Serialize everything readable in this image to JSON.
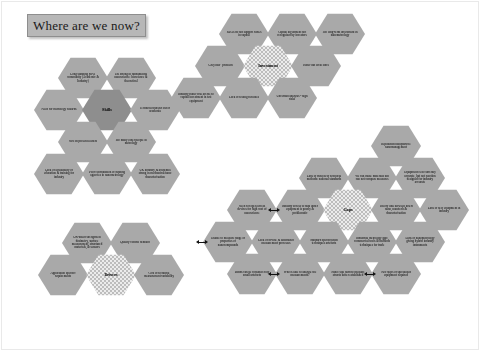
{
  "slide": {
    "title": "Where are we now?",
    "background_color": "#ffffff",
    "hex_fill_color": "#a9a9a9",
    "core_fill_color": "#ececec",
    "title_fill_color": "#b7b7b7"
  },
  "clusters": [
    {
      "id": "skills",
      "core_label": "Skills",
      "cells": [
        {
          "text": "Long standing MNT community (Academic & Industry)"
        },
        {
          "text": "UK strong in fundamental nanoscience: bioscience & theoretical"
        },
        {
          "text": "Need for metrology wizards"
        },
        {
          "text": "Technical transfer out of academia"
        },
        {
          "text": "MN on present leaders"
        },
        {
          "text": "Too many older people in metrology"
        },
        {
          "text": "Lack of availability of education & training for industry"
        },
        {
          "text": "Poor coordination of funding agencies in nanometrology"
        },
        {
          "text": "UK industry & academia strong in mechanical/nano characterisation"
        }
      ]
    },
    {
      "id": "drivers",
      "core_label": "Drivers",
      "cells": [
        {
          "text": "UK-based strengths in dosimetry, surface measurement, structured materials, & sensors"
        },
        {
          "text": "Quality control demand"
        },
        {
          "text": "Application specific requirements"
        },
        {
          "text": "Cost of technical measurement variability"
        }
      ]
    },
    {
      "id": "investment",
      "core_label": "Investment",
      "cells": [
        {
          "text": "RDAs do not support SMEs in capital"
        },
        {
          "text": "Capital investment not recognised by investors"
        },
        {
          "text": "Too long-term investment in nanometrology"
        },
        {
          "text": "\"Grey hair\" problem"
        },
        {
          "text": "Faster but local since"
        },
        {
          "text": "Industry rather risk averse to capital investment in test equipment"
        },
        {
          "text": "Lack of testing facilities"
        },
        {
          "text": "Uncertain analysis - high risks"
        }
      ]
    },
    {
      "id": "gaps",
      "core_label": "Gaps",
      "cells": [
        {
          "text": "Reputation nanoparticle nanomanagement"
        },
        {
          "text": "Lack of trust in/of technical methods: national standards"
        },
        {
          "text": "We can make materials but can not compare measures"
        },
        {
          "text": "Equipment is in currently accurate, but not reaction designed for industry accurate"
        },
        {
          "text": "Need for open access devices for high cost of nanoscience"
        },
        {
          "text": "Industry access to data under equipment is poorly & problematic"
        },
        {
          "text": "Theory link between insert nano, nanotech & characterisation"
        },
        {
          "text": "Lack of new equipment in industry"
        },
        {
          "text": "Unable to measure range of properties of nanocompounds"
        },
        {
          "text": "Lack of fit-line & automated measurement processes"
        },
        {
          "text": "Standard specification techniques artefacts"
        },
        {
          "text": "Industrial metrology gap: commercial tools & methods techniques for trade"
        },
        {
          "text": "Lack of nanometrology giving hybrid industry instruments"
        },
        {
          "text": "Bonds can be considered by small artefacts"
        },
        {
          "text": "Who is able to analyse the measurements?"
        },
        {
          "text": "Nano: still hard to measure structs better established"
        },
        {
          "text": "Two steps of specialised equipment required"
        }
      ]
    }
  ]
}
